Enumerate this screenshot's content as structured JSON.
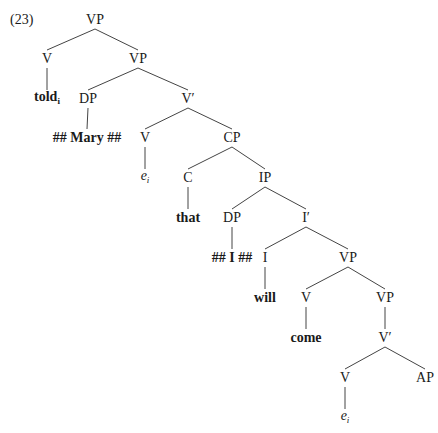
{
  "example_number": "(23)",
  "tree": {
    "nodes": [
      {
        "id": "n0",
        "label": "VP",
        "x": 95,
        "y": 20,
        "style": "normal"
      },
      {
        "id": "n1",
        "label": "V",
        "x": 47,
        "y": 59,
        "style": "normal"
      },
      {
        "id": "n2",
        "label": "VP",
        "x": 138,
        "y": 59,
        "style": "normal"
      },
      {
        "id": "n3",
        "label": "told",
        "sub": "i",
        "x": 47,
        "y": 99,
        "style": "bold"
      },
      {
        "id": "n4",
        "label": "DP",
        "x": 88,
        "y": 99,
        "style": "normal"
      },
      {
        "id": "n5",
        "label": "V′",
        "x": 188,
        "y": 99,
        "style": "normal"
      },
      {
        "id": "n6",
        "label": "## Mary ##",
        "x": 87,
        "y": 138,
        "style": "bold"
      },
      {
        "id": "n7",
        "label": "V",
        "x": 145,
        "y": 138,
        "style": "normal"
      },
      {
        "id": "n8",
        "label": "CP",
        "x": 232,
        "y": 138,
        "style": "normal"
      },
      {
        "id": "n9",
        "label": "e",
        "sub": "i",
        "x": 145,
        "y": 178,
        "style": "italic"
      },
      {
        "id": "n10",
        "label": "C",
        "x": 188,
        "y": 178,
        "style": "normal"
      },
      {
        "id": "n11",
        "label": "IP",
        "x": 265,
        "y": 178,
        "style": "normal"
      },
      {
        "id": "n12",
        "label": "that",
        "x": 188,
        "y": 218,
        "style": "bold"
      },
      {
        "id": "n13",
        "label": "DP",
        "x": 232,
        "y": 218,
        "style": "normal"
      },
      {
        "id": "n14",
        "label": "I′",
        "x": 306,
        "y": 218,
        "style": "normal"
      },
      {
        "id": "n15",
        "label": "## I ##",
        "x": 232,
        "y": 258,
        "style": "bold"
      },
      {
        "id": "n16",
        "label": "I",
        "x": 265,
        "y": 258,
        "style": "normal"
      },
      {
        "id": "n17",
        "label": "VP",
        "x": 348,
        "y": 258,
        "style": "normal"
      },
      {
        "id": "n18",
        "label": "will",
        "x": 265,
        "y": 298,
        "style": "bold"
      },
      {
        "id": "n19",
        "label": "V",
        "x": 306,
        "y": 298,
        "style": "normal"
      },
      {
        "id": "n20",
        "label": "VP",
        "x": 385,
        "y": 298,
        "style": "normal"
      },
      {
        "id": "n21",
        "label": "come",
        "x": 306,
        "y": 338,
        "style": "bold"
      },
      {
        "id": "n22",
        "label": "V′",
        "x": 385,
        "y": 338,
        "style": "normal"
      },
      {
        "id": "n23",
        "label": "V",
        "x": 345,
        "y": 378,
        "style": "normal"
      },
      {
        "id": "n24",
        "label": "AP",
        "x": 425,
        "y": 378,
        "style": "normal"
      },
      {
        "id": "n25",
        "label": "e",
        "sub": "i",
        "x": 345,
        "y": 418,
        "style": "italic"
      }
    ],
    "edges": [
      [
        "n0",
        "n1"
      ],
      [
        "n0",
        "n2"
      ],
      [
        "n1",
        "n3"
      ],
      [
        "n2",
        "n4"
      ],
      [
        "n2",
        "n5"
      ],
      [
        "n4",
        "n6"
      ],
      [
        "n5",
        "n7"
      ],
      [
        "n5",
        "n8"
      ],
      [
        "n7",
        "n9"
      ],
      [
        "n8",
        "n10"
      ],
      [
        "n8",
        "n11"
      ],
      [
        "n10",
        "n12"
      ],
      [
        "n11",
        "n13"
      ],
      [
        "n11",
        "n14"
      ],
      [
        "n13",
        "n15"
      ],
      [
        "n14",
        "n16"
      ],
      [
        "n14",
        "n17"
      ],
      [
        "n16",
        "n18"
      ],
      [
        "n17",
        "n19"
      ],
      [
        "n17",
        "n20"
      ],
      [
        "n19",
        "n21"
      ],
      [
        "n20",
        "n22"
      ],
      [
        "n22",
        "n23"
      ],
      [
        "n22",
        "n24"
      ],
      [
        "n23",
        "n25"
      ]
    ],
    "line_color": "#444444"
  }
}
